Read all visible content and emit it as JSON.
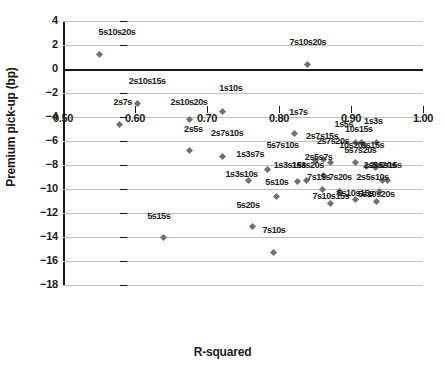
{
  "chart_data": {
    "type": "scatter",
    "title": "",
    "xlabel": "R-squared",
    "ylabel": "Premium pick-up (bp)",
    "xlim": [
      0.5,
      1.0
    ],
    "ylim": [
      -18,
      4
    ],
    "xticks": [
      "0.50",
      "0.60",
      "0.70",
      "0.80",
      "0.90",
      "1.00"
    ],
    "xtick_values": [
      0.5,
      0.6,
      0.7,
      0.8,
      0.9,
      1.0
    ],
    "yticks": [
      "4",
      "2",
      "0",
      "-2",
      "-4",
      "-6",
      "-8",
      "-10",
      "-12",
      "-14",
      "-16",
      "-18"
    ],
    "ytick_values": [
      4,
      2,
      0,
      -2,
      -4,
      -6,
      -8,
      -10,
      -12,
      -14,
      -16,
      -18
    ],
    "grid": true,
    "legend": "none",
    "marker_color": "#6f6f76",
    "points": [
      {
        "label": "5s10s20s",
        "x": 0.55,
        "y": 1.2,
        "lx": 0.575,
        "ly": 2.5
      },
      {
        "label": "7s10s20s",
        "x": 0.84,
        "y": 0.4,
        "lx": 0.84,
        "ly": 1.7
      },
      {
        "label": "2s10s15s",
        "x": 0.603,
        "y": -2.9,
        "lx": 0.617,
        "ly": -1.6
      },
      {
        "label": "2s7s",
        "x": 0.578,
        "y": -4.6,
        "lx": 0.583,
        "ly": -3.3
      },
      {
        "label": "1s10s",
        "x": 0.721,
        "y": -3.5,
        "lx": 0.733,
        "ly": -2.2
      },
      {
        "label": "2s10s20s",
        "x": 0.675,
        "y": -4.2,
        "lx": 0.675,
        "ly": -3.3
      },
      {
        "label": "1s7s",
        "x": 0.822,
        "y": -5.4,
        "lx": 0.827,
        "ly": -4.2
      },
      {
        "label": "1s3s",
        "x": 0.936,
        "y": -6.1,
        "lx": 0.931,
        "ly": -4.9
      },
      {
        "label": "1s5s",
        "x": 0.906,
        "y": -6.1,
        "lx": 0.89,
        "ly": -5.2
      },
      {
        "label": "10s15s",
        "x": 0.915,
        "y": -6.1,
        "lx": 0.911,
        "ly": -5.6
      },
      {
        "label": "2s5s",
        "x": 0.675,
        "y": -6.8,
        "lx": 0.681,
        "ly": -5.6
      },
      {
        "label": "2s7s10s",
        "x": 0.721,
        "y": -7.3,
        "lx": 0.728,
        "ly": -5.9
      },
      {
        "label": "2s7s15s",
        "x": 0.862,
        "y": -7.5,
        "lx": 0.86,
        "ly": -6.2
      },
      {
        "label": "2s7s20s",
        "x": 0.872,
        "y": -7.8,
        "lx": 0.875,
        "ly": -6.6
      },
      {
        "label": "10s20s",
        "x": 0.906,
        "y": -7.8,
        "lx": 0.903,
        "ly": -6.9
      },
      {
        "label": "5s15s",
        "x": 0.922,
        "y": -8.1,
        "lx": 0.93,
        "ly": -6.9
      },
      {
        "label": "5s7s10s",
        "x": 0.85,
        "y": -7.6,
        "lx": 0.805,
        "ly": -6.9
      },
      {
        "label": "5s7s20s",
        "x": 0.934,
        "y": -8.2,
        "lx": 0.913,
        "ly": -7.3
      },
      {
        "label": "1s3s7s",
        "x": 0.784,
        "y": -8.4,
        "lx": 0.76,
        "ly": -7.7
      },
      {
        "label": "2s5s7s",
        "x": 0.862,
        "y": -8.9,
        "lx": 0.855,
        "ly": -7.9
      },
      {
        "label": "1s3s15s",
        "x": 0.826,
        "y": -9.4,
        "lx": 0.815,
        "ly": -8.6
      },
      {
        "label": "1s3s20s",
        "x": 0.838,
        "y": -9.3,
        "lx": 0.84,
        "ly": -8.6
      },
      {
        "label": "2s5s20s",
        "x": 0.944,
        "y": -9.3,
        "lx": 0.94,
        "ly": -8.6
      },
      {
        "label": "2s5s15s",
        "x": 0.95,
        "y": -9.3,
        "lx": 0.948,
        "ly": -8.6
      },
      {
        "label": "1s3s10s",
        "x": 0.758,
        "y": -9.3,
        "lx": 0.748,
        "ly": -9.3
      },
      {
        "label": "7s15s",
        "x": 0.86,
        "y": -10.0,
        "lx": 0.855,
        "ly": -9.6
      },
      {
        "label": "7s20s",
        "x": 0.884,
        "y": -10.2,
        "lx": 0.885,
        "ly": -9.6
      },
      {
        "label": "2s5s10s",
        "x": 0.94,
        "y": -10.2,
        "lx": 0.93,
        "ly": -9.6
      },
      {
        "label": "5s10s",
        "x": 0.797,
        "y": -10.6,
        "lx": 0.797,
        "ly": -10.0
      },
      {
        "label": "7s10s15s",
        "x": 0.872,
        "y": -11.2,
        "lx": 0.872,
        "ly": -11.2
      },
      {
        "label": "5s10s15s",
        "x": 0.906,
        "y": -10.9,
        "lx": 0.906,
        "ly": -10.9
      },
      {
        "label": "5s10s20s",
        "x": 0.935,
        "y": -11.0,
        "lx": 0.935,
        "ly": -11.0
      },
      {
        "label": "5s20s",
        "x": 0.763,
        "y": -13.1,
        "lx": 0.757,
        "ly": -11.9
      },
      {
        "label": "5s15s",
        "x": 0.639,
        "y": -14.0,
        "lx": 0.633,
        "ly": -12.8
      },
      {
        "label": "7s10s",
        "x": 0.793,
        "y": -15.3,
        "lx": 0.793,
        "ly": -14.0
      }
    ]
  }
}
